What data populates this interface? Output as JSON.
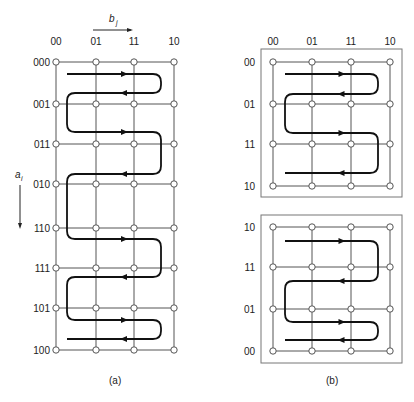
{
  "figure": {
    "top_text_fragment": "",
    "panel_a": {
      "caption": "(a)",
      "column_axis_label": "b",
      "column_axis_subscript": "j",
      "row_axis_label": "a",
      "row_axis_subscript": "i",
      "columns": [
        "00",
        "01",
        "11",
        "10"
      ],
      "rows": [
        "000",
        "001",
        "011",
        "010",
        "110",
        "111",
        "101",
        "100"
      ]
    },
    "panel_b": {
      "caption": "(b)",
      "columns": [
        "00",
        "01",
        "11",
        "10"
      ],
      "top_grid_rows": [
        "00",
        "01",
        "11",
        "10"
      ],
      "bottom_grid_rows": [
        "10",
        "11",
        "01",
        "00"
      ]
    }
  },
  "layout": {
    "a_cols_x": [
      56,
      96,
      134,
      174
    ],
    "a_rows_y": [
      62,
      104,
      144,
      184,
      228,
      268,
      308,
      350
    ],
    "b_cols_x": [
      273,
      312,
      351,
      390
    ],
    "b_top_rows_y": [
      62,
      104,
      144,
      186
    ],
    "b_bottom_rows_y": [
      227,
      267,
      309,
      351
    ],
    "b_top_box": [
      261,
      49,
      141,
      148
    ],
    "b_bottom_box": [
      261,
      215,
      141,
      148
    ],
    "a_path": [
      [
        67,
        74,
        "r"
      ],
      [
        67,
        93,
        "l"
      ],
      [
        67,
        132,
        "r"
      ],
      [
        67,
        174,
        "l"
      ],
      [
        67,
        239,
        "r"
      ],
      [
        67,
        277,
        "l"
      ],
      [
        67,
        320,
        "r"
      ],
      [
        67,
        339,
        "l"
      ]
    ],
    "a_turn_right_x": 161,
    "a_turn_left_x": 67,
    "b_top_path": [
      [
        285,
        74,
        "r"
      ],
      [
        285,
        94,
        "l"
      ],
      [
        285,
        133,
        "r"
      ],
      [
        285,
        173,
        "l"
      ]
    ],
    "b_bottom_path": [
      [
        285,
        241,
        "r"
      ],
      [
        285,
        281,
        "l"
      ],
      [
        285,
        322,
        "r"
      ],
      [
        285,
        340,
        "l"
      ]
    ],
    "b_turn_right_x": 378,
    "b_turn_left_x": 285
  }
}
